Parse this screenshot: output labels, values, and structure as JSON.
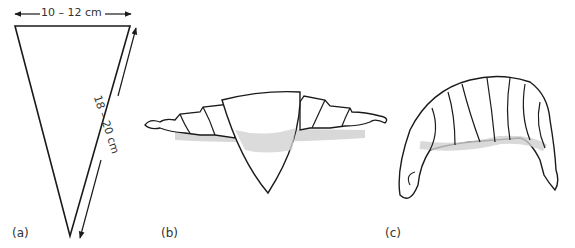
{
  "figure": {
    "panels": [
      {
        "id": "a",
        "label": "(a)",
        "description": "Triangle of dough with dimensions"
      },
      {
        "id": "b",
        "label": "(b)",
        "description": "Triangle partially rolled from the base"
      },
      {
        "id": "c",
        "label": "(c)",
        "description": "Fully rolled and curved croissant"
      }
    ],
    "dimensions": {
      "base": "10 – 12 cm",
      "side": "18 – 20 cm"
    },
    "colors": {
      "line": "#1a1a1a",
      "shade": "#cfcfcf",
      "shade_light": "#e6e6e6"
    }
  }
}
